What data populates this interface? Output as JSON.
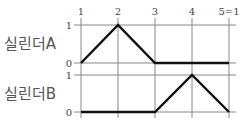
{
  "diagram": {
    "type": "displacement-step-diagram",
    "steps": [
      "1",
      "2",
      "3",
      "4",
      "5=1"
    ],
    "rows": [
      {
        "label": "실린더A",
        "y_labels": {
          "high": "1",
          "low": "0"
        },
        "values": [
          0,
          1,
          0,
          0,
          0
        ]
      },
      {
        "label": "실린더B",
        "y_labels": {
          "high": "1",
          "low": "0"
        },
        "values": [
          0,
          0,
          0,
          1,
          0
        ]
      }
    ],
    "colors": {
      "grid": "#888888",
      "trace": "#111111",
      "text": "#444444"
    }
  }
}
